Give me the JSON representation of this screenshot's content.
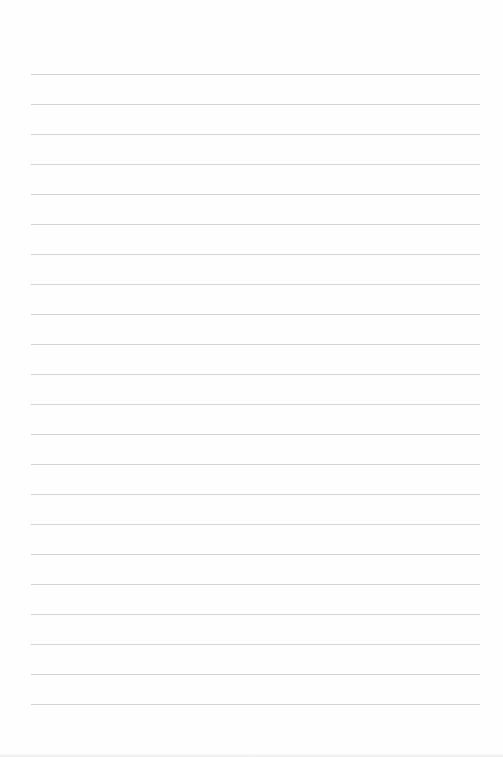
{
  "page": {
    "type": "blank lined paper",
    "line_color": "#d4d4d4",
    "background": "#fefefe",
    "line_count": 22,
    "first_line_y": 74,
    "line_spacing": 30,
    "line_left": 31,
    "line_width": 449
  }
}
